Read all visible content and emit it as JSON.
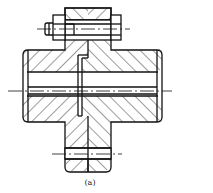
{
  "figure": {
    "caption": "(a)",
    "line_color": "#111111",
    "background": "#ffffff"
  }
}
